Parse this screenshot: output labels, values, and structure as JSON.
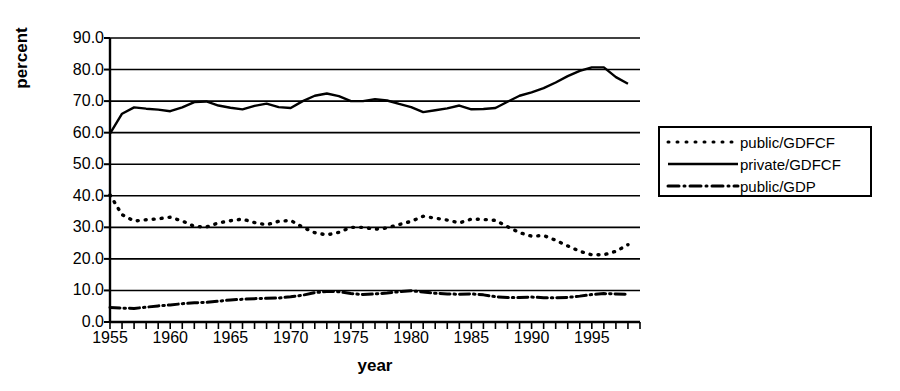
{
  "chart_data": {
    "type": "line",
    "title": "",
    "xlabel": "year",
    "ylabel": "percent",
    "xlim": [
      1955,
      1999
    ],
    "ylim": [
      0,
      90
    ],
    "yticks": [
      "0.0",
      "10.0",
      "20.0",
      "30.0",
      "40.0",
      "50.0",
      "60.0",
      "70.0",
      "80.0",
      "90.0"
    ],
    "ytick_values": [
      0,
      10,
      20,
      30,
      40,
      50,
      60,
      70,
      80,
      90
    ],
    "xticks": [
      "1955",
      "1960",
      "1965",
      "1970",
      "1975",
      "1980",
      "1985",
      "1990",
      "1995"
    ],
    "xtick_values": [
      1955,
      1960,
      1965,
      1970,
      1975,
      1980,
      1985,
      1990,
      1995
    ],
    "minor_xtick_interval": 1,
    "grid": "horizontal",
    "legend_position": "right-outside",
    "x": [
      1955,
      1956,
      1957,
      1958,
      1959,
      1960,
      1961,
      1962,
      1963,
      1964,
      1965,
      1966,
      1967,
      1968,
      1969,
      1970,
      1971,
      1972,
      1973,
      1974,
      1975,
      1976,
      1977,
      1978,
      1979,
      1980,
      1981,
      1982,
      1983,
      1984,
      1985,
      1986,
      1987,
      1988,
      1989,
      1990,
      1991,
      1992,
      1993,
      1994,
      1995,
      1996,
      1997,
      1998
    ],
    "series": [
      {
        "name": "public/GDFCF",
        "style": "dotted",
        "color": "#000000",
        "values": [
          40.3,
          34.0,
          32.0,
          32.4,
          32.7,
          33.2,
          32.0,
          30.3,
          30.1,
          31.4,
          32.1,
          32.6,
          31.5,
          30.8,
          31.9,
          32.2,
          30.0,
          28.3,
          27.6,
          28.4,
          30.0,
          30.0,
          29.4,
          29.8,
          30.9,
          31.9,
          33.5,
          32.9,
          32.3,
          31.4,
          32.6,
          32.5,
          32.2,
          30.2,
          28.3,
          27.2,
          27.4,
          25.9,
          24.1,
          22.4,
          21.3,
          21.3,
          22.4,
          24.5
        ]
      },
      {
        "name": "private/GDFCF",
        "style": "solid",
        "color": "#000000",
        "values": [
          59.7,
          66.0,
          68.0,
          67.6,
          67.3,
          66.8,
          68.0,
          69.7,
          69.9,
          68.6,
          67.9,
          67.4,
          68.5,
          69.2,
          68.1,
          67.8,
          70.0,
          71.7,
          72.4,
          71.6,
          70.0,
          70.0,
          70.6,
          70.2,
          69.1,
          68.1,
          66.5,
          67.1,
          67.7,
          68.6,
          67.4,
          67.5,
          67.8,
          69.8,
          71.7,
          72.8,
          74.1,
          75.9,
          77.9,
          79.6,
          80.7,
          80.7,
          77.6,
          75.5
        ]
      },
      {
        "name": "public/GDP",
        "style": "dash-dot",
        "color": "#000000",
        "values": [
          4.6,
          4.4,
          4.3,
          4.7,
          5.1,
          5.4,
          5.8,
          6.1,
          6.2,
          6.6,
          7.0,
          7.2,
          7.4,
          7.5,
          7.6,
          8.0,
          8.5,
          9.3,
          9.7,
          9.6,
          9.0,
          8.7,
          8.9,
          9.2,
          9.6,
          9.9,
          9.5,
          9.1,
          8.9,
          8.8,
          8.9,
          8.6,
          8.0,
          7.8,
          7.8,
          7.9,
          7.7,
          7.7,
          7.8,
          8.2,
          8.7,
          9.0,
          8.9,
          8.8
        ]
      }
    ]
  },
  "legend": {
    "items": [
      {
        "label": "public/GDFCF",
        "style": "dotted"
      },
      {
        "label": "private/GDFCF",
        "style": "solid"
      },
      {
        "label": "public/GDP",
        "style": "dash-dot"
      }
    ]
  }
}
